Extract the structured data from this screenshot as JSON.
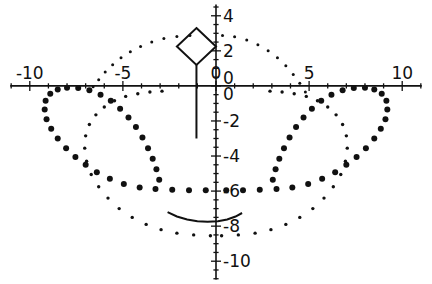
{
  "figure": {
    "title": "",
    "background_color": "#ffffff",
    "ink_color": "#111111",
    "width": 432,
    "height": 284
  },
  "chart_data": {
    "type": "scatter",
    "title": "",
    "xlabel": "",
    "ylabel": "",
    "xlim": [
      -11.6,
      11.6
    ],
    "ylim": [
      -11.3,
      4.9
    ],
    "grid": false,
    "legend": null,
    "axes": {
      "x_axis": {
        "tick_labels": [
          "-10",
          "-5",
          "0",
          "5",
          "10"
        ],
        "tick_values": [
          -10,
          -5,
          0,
          5,
          10
        ],
        "minor_tick_step": 1,
        "label_position": "above-axis",
        "axis_y_value": 0
      },
      "y_axis": {
        "tick_labels": [
          "4",
          "2",
          "0",
          "0",
          "-2",
          "-4",
          "-6",
          "-8",
          "-10"
        ],
        "tick_values": [
          4,
          2,
          0.45,
          -0.45,
          -2,
          -4,
          -6,
          -8,
          -10
        ],
        "minor_tick_step": 0.5,
        "label_position": "right-of-axis",
        "axis_x_value": 0
      }
    },
    "series": [
      {
        "name": "outer-dotted-loop-large-dots",
        "style": "dotted",
        "marker_size": 3.0,
        "points": [
          [
            -0.55,
            -5.95
          ],
          [
            -1.45,
            -5.95
          ],
          [
            -2.35,
            -5.92
          ],
          [
            -3.25,
            -5.88
          ],
          [
            -4.1,
            -5.8
          ],
          [
            -4.95,
            -5.6
          ],
          [
            -5.7,
            -5.3
          ],
          [
            -6.4,
            -4.92
          ],
          [
            -7.0,
            -4.5
          ],
          [
            -7.55,
            -4.05
          ],
          [
            -8.05,
            -3.55
          ],
          [
            -8.5,
            -3.0
          ],
          [
            -8.85,
            -2.45
          ],
          [
            -9.1,
            -1.9
          ],
          [
            -9.2,
            -1.35
          ],
          [
            -9.15,
            -0.85
          ],
          [
            -8.9,
            -0.45
          ],
          [
            -8.5,
            -0.2
          ],
          [
            -8.0,
            -0.1
          ],
          [
            -7.4,
            -0.12
          ],
          [
            -6.8,
            -0.25
          ],
          [
            -6.2,
            -0.5
          ],
          [
            -5.65,
            -0.85
          ],
          [
            -5.15,
            -1.3
          ],
          [
            -4.7,
            -1.8
          ],
          [
            -4.3,
            -2.35
          ],
          [
            -3.95,
            -2.95
          ],
          [
            -3.65,
            -3.55
          ],
          [
            -3.4,
            -4.15
          ],
          [
            -3.2,
            -4.75
          ],
          [
            -3.05,
            -5.35
          ],
          [
            0.55,
            -5.95
          ],
          [
            1.45,
            -5.95
          ],
          [
            2.35,
            -5.92
          ],
          [
            3.25,
            -5.88
          ],
          [
            4.1,
            -5.8
          ],
          [
            4.95,
            -5.6
          ],
          [
            5.7,
            -5.3
          ],
          [
            6.4,
            -4.92
          ],
          [
            7.0,
            -4.5
          ],
          [
            7.55,
            -4.05
          ],
          [
            8.05,
            -3.55
          ],
          [
            8.5,
            -3.0
          ],
          [
            8.85,
            -2.45
          ],
          [
            9.1,
            -1.9
          ],
          [
            9.2,
            -1.35
          ],
          [
            9.15,
            -0.85
          ],
          [
            8.9,
            -0.45
          ],
          [
            8.5,
            -0.2
          ],
          [
            8.0,
            -0.1
          ],
          [
            7.4,
            -0.12
          ],
          [
            6.8,
            -0.25
          ],
          [
            6.2,
            -0.5
          ],
          [
            5.65,
            -0.85
          ],
          [
            5.15,
            -1.3
          ],
          [
            4.7,
            -1.8
          ],
          [
            4.3,
            -2.35
          ],
          [
            3.95,
            -2.95
          ],
          [
            3.65,
            -3.55
          ],
          [
            3.4,
            -4.15
          ],
          [
            3.2,
            -4.75
          ],
          [
            3.05,
            -5.35
          ]
        ]
      },
      {
        "name": "inner-dotted-arc-small-dots",
        "style": "dotted",
        "marker_size": 1.7,
        "points": [
          [
            -0.3,
            -8.55
          ],
          [
            -1.2,
            -8.5
          ],
          [
            -2.1,
            -8.4
          ],
          [
            -2.95,
            -8.2
          ],
          [
            -3.75,
            -7.9
          ],
          [
            -4.5,
            -7.5
          ],
          [
            -5.2,
            -7.0
          ],
          [
            -5.8,
            -6.4
          ],
          [
            -6.3,
            -5.75
          ],
          [
            -6.7,
            -5.05
          ],
          [
            -6.95,
            -4.3
          ],
          [
            -7.05,
            -3.55
          ],
          [
            -7.0,
            -2.85
          ],
          [
            -6.8,
            -2.2
          ],
          [
            -6.45,
            -1.65
          ],
          [
            -6.0,
            -1.2
          ],
          [
            -5.45,
            -0.85
          ],
          [
            -4.85,
            -0.6
          ],
          [
            -4.2,
            -0.45
          ],
          [
            -3.55,
            -0.35
          ],
          [
            -2.9,
            -0.3
          ],
          [
            0.3,
            -8.55
          ],
          [
            1.2,
            -8.5
          ],
          [
            2.1,
            -8.4
          ],
          [
            2.95,
            -8.2
          ],
          [
            3.75,
            -7.9
          ],
          [
            4.5,
            -7.5
          ],
          [
            5.2,
            -7.0
          ],
          [
            5.8,
            -6.4
          ],
          [
            6.3,
            -5.75
          ],
          [
            6.7,
            -5.05
          ],
          [
            6.95,
            -4.3
          ],
          [
            7.05,
            -3.55
          ],
          [
            7.0,
            -2.85
          ],
          [
            6.8,
            -2.2
          ],
          [
            6.45,
            -1.65
          ],
          [
            6.0,
            -1.2
          ],
          [
            5.45,
            -0.85
          ],
          [
            4.85,
            -0.6
          ],
          [
            4.2,
            -0.45
          ],
          [
            3.55,
            -0.35
          ],
          [
            2.9,
            -0.3
          ]
        ]
      },
      {
        "name": "upper-dotted-arc-small-dots",
        "style": "dotted",
        "marker_size": 1.5,
        "points": [
          [
            -6.6,
            -0.05
          ],
          [
            -6.3,
            0.35
          ],
          [
            -5.95,
            0.8
          ],
          [
            -5.55,
            1.2
          ],
          [
            -5.1,
            1.6
          ],
          [
            -4.6,
            1.95
          ],
          [
            -4.05,
            2.25
          ],
          [
            -3.45,
            2.5
          ],
          [
            -2.8,
            2.7
          ],
          [
            -2.1,
            2.82
          ],
          [
            -1.4,
            2.88
          ],
          [
            0.35,
            2.88
          ],
          [
            1.0,
            2.8
          ],
          [
            1.65,
            2.62
          ],
          [
            2.25,
            2.35
          ],
          [
            2.8,
            2.0
          ],
          [
            3.3,
            1.6
          ],
          [
            3.75,
            1.15
          ],
          [
            4.15,
            0.65
          ],
          [
            4.5,
            0.15
          ],
          [
            4.8,
            -0.35
          ]
        ]
      },
      {
        "name": "diamond-outline",
        "style": "solid",
        "closed": true,
        "points": [
          [
            -1.05,
            3.3
          ],
          [
            0.0,
            2.25
          ],
          [
            -1.05,
            1.2
          ],
          [
            -2.1,
            2.25
          ]
        ]
      },
      {
        "name": "diamond-stem",
        "style": "solid",
        "points": [
          [
            -1.05,
            1.2
          ],
          [
            -1.05,
            -3.0
          ]
        ]
      },
      {
        "name": "lower-solid-arc",
        "style": "solid",
        "points": [
          [
            -2.6,
            -7.2
          ],
          [
            -2.1,
            -7.45
          ],
          [
            -1.55,
            -7.62
          ],
          [
            -1.0,
            -7.72
          ],
          [
            -0.45,
            -7.75
          ],
          [
            0.1,
            -7.72
          ],
          [
            0.6,
            -7.62
          ],
          [
            1.05,
            -7.45
          ],
          [
            1.4,
            -7.25
          ]
        ]
      }
    ]
  }
}
